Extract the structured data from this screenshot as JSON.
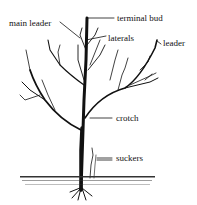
{
  "diagram": {
    "labels": {
      "terminal_bud": "terminal bud",
      "main_leader": "main leader",
      "laterals": "laterals",
      "leader": "leader",
      "crotch": "crotch",
      "suckers": "suckers"
    }
  }
}
